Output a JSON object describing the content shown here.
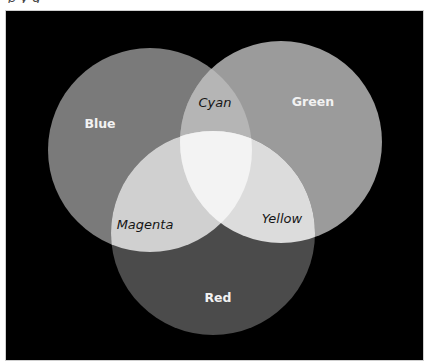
{
  "caption_fragment": "p    y                    g",
  "diagram": {
    "type": "venn-3-additive-color",
    "background": "#000000",
    "regions": {
      "blue": {
        "label": "Blue",
        "color": "#7a7a7a"
      },
      "green": {
        "label": "Green",
        "color": "#9b9b9b"
      },
      "red": {
        "label": "Red",
        "color": "#4b4b4b"
      },
      "cyan": {
        "label": "Cyan",
        "color": "#b5b5b5"
      },
      "magenta": {
        "label": "Magenta",
        "color": "#d0d0d0"
      },
      "yellow": {
        "label": "Yellow",
        "color": "#dcdcdc"
      },
      "white": {
        "label": "",
        "color": "#f3f3f3"
      }
    },
    "circles": [
      {
        "name": "Blue",
        "cx": 150,
        "cy": 150,
        "r": 102
      },
      {
        "name": "Green",
        "cx": 281,
        "cy": 142,
        "r": 101
      },
      {
        "name": "Red",
        "cx": 213,
        "cy": 233,
        "r": 102
      }
    ]
  }
}
